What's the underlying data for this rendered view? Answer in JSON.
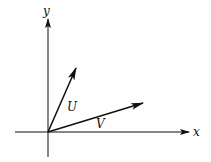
{
  "diagram": {
    "type": "vector-diagram",
    "axes": {
      "x_label": "x",
      "y_label": "y",
      "origin": [
        48,
        132
      ],
      "x_axis": {
        "from": [
          15,
          132
        ],
        "to": [
          190,
          132
        ]
      },
      "y_axis": {
        "from": [
          48,
          157
        ],
        "to": [
          48,
          19
        ]
      }
    },
    "vectors": [
      {
        "name": "U",
        "label": "U",
        "from": [
          48,
          132
        ],
        "to": [
          76,
          68
        ],
        "label_pos": [
          67,
          111
        ]
      },
      {
        "name": "V",
        "label": "V",
        "from": [
          48,
          132
        ],
        "to": [
          143,
          103
        ],
        "label_pos": [
          96,
          128
        ]
      }
    ],
    "colors": {
      "ink": "#111111",
      "background": "#fefefe"
    }
  }
}
